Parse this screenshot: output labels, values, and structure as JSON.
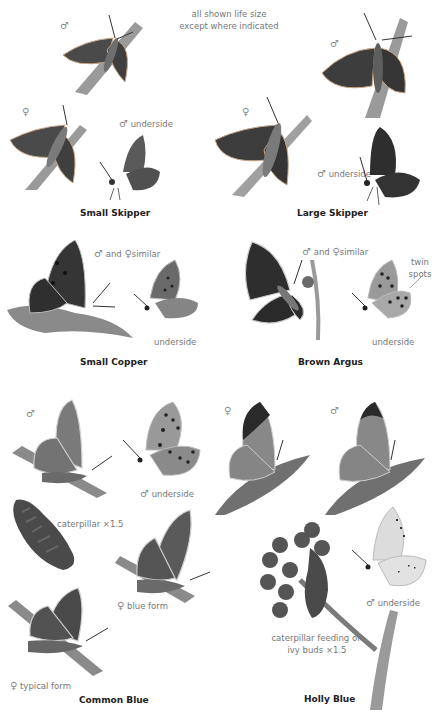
{
  "header_note": {
    "line1": "all shown life size",
    "line2": "except where indicated"
  },
  "symbols": {
    "male": "♂",
    "female": "♀"
  },
  "species": [
    {
      "name": "Small Skipper",
      "labels": {
        "male": "♂",
        "female": "♀",
        "male_underside": "underside"
      }
    },
    {
      "name": "Large Skipper",
      "labels": {
        "male": "♂",
        "female": "♀",
        "male_underside": "underside"
      }
    },
    {
      "name": "Small Copper",
      "labels": {
        "similar_and": "and",
        "similar": "similar",
        "underside": "underside"
      }
    },
    {
      "name": "Brown Argus",
      "labels": {
        "similar_and": "and",
        "similar": "similar",
        "twin_spots_1": "twin",
        "twin_spots_2": "spots",
        "underside": "underside"
      }
    },
    {
      "name": "Common Blue",
      "labels": {
        "male": "♂",
        "male_underside": "underside",
        "caterpillar": "caterpillar ×1.5",
        "blue_form": "blue form",
        "typical_form": "typical form"
      }
    },
    {
      "name": "Holly Blue",
      "labels": {
        "female": "♀",
        "male": "♂",
        "male_underside": "underside",
        "caterpillar_1": "caterpillar feeding on",
        "caterpillar_2": "ivy buds ×1.5"
      }
    }
  ],
  "colors": {
    "skipper_wing": "#4a4a4a",
    "copper_wing": "#3d3d3d",
    "argus_wing": "#2e2e2e",
    "blue_wing": "#7a7a7a",
    "holly_underside": "#dcdcdc",
    "stem": "#9a9a9a",
    "label_text": "#777777",
    "title_text": "#222222"
  }
}
